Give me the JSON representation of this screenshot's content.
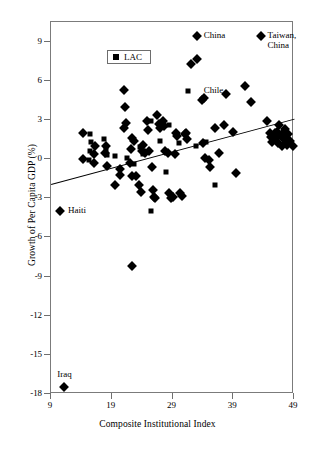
{
  "chart_data": {
    "type": "scatter",
    "title": "",
    "xlabel": "Composite Institutional Index",
    "ylabel": "Growth of Per Capita GDP (%)",
    "xlim": [
      9,
      49
    ],
    "ylim": [
      -18,
      10.5
    ],
    "xticks": [
      9,
      19,
      29,
      39,
      49
    ],
    "yticks": [
      9,
      6,
      3,
      0,
      -3,
      -6,
      -9,
      -12,
      -15,
      -18
    ],
    "grid": false,
    "legend": {
      "position": "top-left-inside",
      "entries": [
        {
          "marker": "square",
          "label": "LAC"
        }
      ]
    },
    "marker_meaning": {
      "square": "LAC (Latin America and the Caribbean) economy",
      "diamond": "Non-LAC economy"
    },
    "annotations": [
      {
        "label": "China",
        "x": 33.0,
        "y": 9.4,
        "marker": "diamond"
      },
      {
        "label": "Taiwan, China",
        "x": 43.5,
        "y": 9.4,
        "marker": "diamond"
      },
      {
        "label": "Chile",
        "x": 33.0,
        "y": 5.2,
        "marker": "square"
      },
      {
        "label": "Haiti",
        "x": 10.5,
        "y": -4.0,
        "marker": "diamond"
      },
      {
        "label": "Iraq",
        "x": 11.2,
        "y": -17.5,
        "marker": "diamond"
      }
    ],
    "trendline": {
      "type": "linear-fit",
      "x_start": 9,
      "y_start": -1.9,
      "x_end": 49,
      "y_end": 3.1
    },
    "series": [
      {
        "name": "LAC",
        "marker": "square",
        "points": [
          [
            15.5,
            1.9
          ],
          [
            15.6,
            1.3
          ],
          [
            15.4,
            0.6
          ],
          [
            15.3,
            -0.1
          ],
          [
            18.0,
            0.7
          ],
          [
            18.2,
            0.3
          ],
          [
            17.8,
            1.5
          ],
          [
            19.5,
            0.2
          ],
          [
            23.6,
            0.9
          ],
          [
            24.2,
            0.4
          ],
          [
            25.4,
            2.9
          ],
          [
            27.0,
            1.4
          ],
          [
            28.0,
            -1.0
          ],
          [
            28.5,
            2.6
          ],
          [
            30.0,
            1.2
          ],
          [
            31.5,
            5.2
          ],
          [
            32.8,
            1.0
          ],
          [
            25.4,
            -4.0
          ],
          [
            21.5,
            0.1
          ],
          [
            22.6,
            -0.4
          ],
          [
            34.5,
            1.3
          ],
          [
            36.0,
            -2.0
          ]
        ]
      },
      {
        "name": "Non-LAC",
        "marker": "diamond",
        "points": [
          [
            14.3,
            2.0
          ],
          [
            14.2,
            0.0
          ],
          [
            16.0,
            0.4
          ],
          [
            16.1,
            -0.3
          ],
          [
            16.3,
            1.0
          ],
          [
            17.9,
            0.5
          ],
          [
            18.1,
            1.0
          ],
          [
            18.3,
            -0.5
          ],
          [
            19.6,
            -2.0
          ],
          [
            20.3,
            -1.2
          ],
          [
            20.3,
            -0.8
          ],
          [
            21.0,
            5.3
          ],
          [
            21.2,
            4.0
          ],
          [
            21.4,
            2.8
          ],
          [
            21.0,
            2.4
          ],
          [
            22.2,
            0.8
          ],
          [
            22.4,
            1.6
          ],
          [
            22.6,
            1.4
          ],
          [
            22.0,
            -0.3
          ],
          [
            22.4,
            -1.3
          ],
          [
            23.0,
            -1.3
          ],
          [
            23.5,
            -2.0
          ],
          [
            23.8,
            -2.5
          ],
          [
            24.0,
            0.6
          ],
          [
            24.2,
            1.1
          ],
          [
            24.4,
            0.5
          ],
          [
            24.8,
            2.9
          ],
          [
            25.0,
            2.2
          ],
          [
            25.2,
            0.6
          ],
          [
            25.6,
            -0.6
          ],
          [
            25.8,
            -2.4
          ],
          [
            26.0,
            -2.9
          ],
          [
            26.2,
            -3.0
          ],
          [
            26.5,
            3.4
          ],
          [
            26.7,
            2.7
          ],
          [
            26.9,
            2.4
          ],
          [
            27.4,
            2.9
          ],
          [
            27.6,
            2.5
          ],
          [
            27.8,
            0.6
          ],
          [
            28.2,
            0.5
          ],
          [
            28.4,
            -2.6
          ],
          [
            28.8,
            -3.0
          ],
          [
            29.0,
            -2.9
          ],
          [
            29.4,
            0.4
          ],
          [
            29.6,
            2.0
          ],
          [
            29.8,
            1.8
          ],
          [
            30.2,
            -2.6
          ],
          [
            30.6,
            -2.8
          ],
          [
            31.0,
            1.9
          ],
          [
            31.2,
            2.0
          ],
          [
            31.4,
            1.5
          ],
          [
            32.0,
            7.3
          ],
          [
            33.0,
            7.7
          ],
          [
            33.0,
            9.4
          ],
          [
            33.8,
            4.5
          ],
          [
            34.2,
            4.7
          ],
          [
            34.0,
            1.2
          ],
          [
            34.4,
            0.1
          ],
          [
            35.0,
            -0.1
          ],
          [
            35.2,
            -0.6
          ],
          [
            36.0,
            2.4
          ],
          [
            36.6,
            0.5
          ],
          [
            37.5,
            2.6
          ],
          [
            37.8,
            5.0
          ],
          [
            39.0,
            2.1
          ],
          [
            39.5,
            -1.1
          ],
          [
            41.0,
            5.6
          ],
          [
            42.0,
            4.4
          ],
          [
            43.5,
            9.4
          ],
          [
            44.5,
            2.9
          ],
          [
            45.0,
            2.0
          ],
          [
            45.2,
            1.7
          ],
          [
            45.4,
            1.3
          ],
          [
            45.8,
            2.0
          ],
          [
            46.0,
            1.6
          ],
          [
            46.2,
            2.1
          ],
          [
            46.4,
            1.2
          ],
          [
            46.6,
            2.6
          ],
          [
            46.8,
            1.8
          ],
          [
            47.0,
            1.0
          ],
          [
            47.2,
            2.0
          ],
          [
            47.4,
            1.5
          ],
          [
            47.6,
            2.3
          ],
          [
            47.8,
            1.1
          ],
          [
            48.0,
            1.9
          ],
          [
            48.4,
            1.4
          ],
          [
            48.8,
            1.0
          ],
          [
            10.5,
            -4.0
          ],
          [
            11.2,
            -17.5
          ],
          [
            22.3,
            -8.2
          ]
        ]
      }
    ]
  }
}
